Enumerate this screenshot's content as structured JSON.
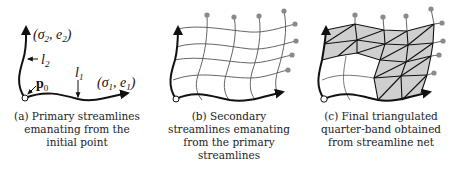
{
  "figure": {
    "panels": [
      {
        "id": "a",
        "labels": {
          "sigma2": "(σ",
          "sigma2_sub": "2",
          "e2": ", e",
          "e2_sub": "2",
          "close2": ")",
          "sigma1": "(σ",
          "sigma1_sub": "1",
          "e1": ", e",
          "e1_sub": "1",
          "close1": ")",
          "l1": "l",
          "l1_sub": "1",
          "l2": "l",
          "l2_sub": "2",
          "p0": "p",
          "p0_sub": "0"
        },
        "caption": [
          "(a) Primary streamlines",
          "emanating from the",
          "initial point"
        ]
      },
      {
        "id": "b",
        "caption": [
          "(b) Secondary",
          "streamlines emanating",
          "from the primary",
          "streamlines"
        ]
      },
      {
        "id": "c",
        "caption": [
          "(c) Final triangulated",
          "quarter-band obtained",
          "from streamline net"
        ]
      }
    ],
    "colors": {
      "line": "#111111",
      "grid": "#555555",
      "dot": "#8a8a8a",
      "fill": "#cfcfcf"
    }
  }
}
